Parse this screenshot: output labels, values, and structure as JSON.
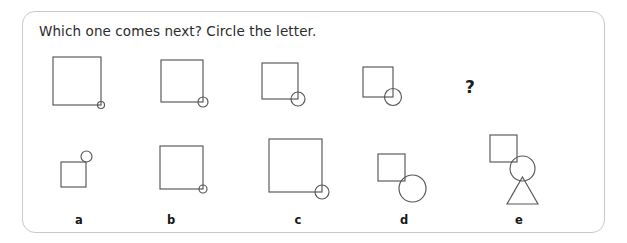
{
  "worksheet": {
    "prompt": "Which one comes next? Circle the letter.",
    "missing_marker": "?",
    "border_color": "#c9c9c9",
    "stroke_color": "#55565a",
    "text_color": "#2b2b2b",
    "background_color": "#ffffff"
  },
  "sequence": {
    "name": "square-shrinking-circle-growing",
    "items": [
      {
        "index": 1,
        "square_size": 48,
        "circle_diameter": 7,
        "circle_anchor": "bottom-right-corner",
        "left": 52,
        "top": 56
      },
      {
        "index": 2,
        "square_size": 42,
        "circle_diameter": 10,
        "circle_anchor": "bottom-right-corner",
        "left": 160,
        "top": 59
      },
      {
        "index": 3,
        "square_size": 36,
        "circle_diameter": 14,
        "circle_anchor": "bottom-right-corner",
        "left": 261,
        "top": 62
      },
      {
        "index": 4,
        "square_size": 30,
        "circle_diameter": 17,
        "circle_anchor": "bottom-right-corner",
        "left": 362,
        "top": 66
      }
    ],
    "question_mark": {
      "label": "?",
      "left": 464,
      "top": 76
    }
  },
  "options": [
    {
      "letter": "a",
      "letter_left": 68,
      "shapes": [
        {
          "type": "square",
          "size": 25,
          "left": 60,
          "top": 161
        },
        {
          "type": "circle",
          "diameter": 11,
          "left": 80,
          "top": 150
        }
      ],
      "description": "small square with small circle at top-right corner"
    },
    {
      "letter": "b",
      "letter_left": 160,
      "shapes": [
        {
          "type": "square",
          "size": 43,
          "left": 159,
          "top": 145
        },
        {
          "type": "circle",
          "diameter": 8,
          "left": 198,
          "top": 184
        }
      ],
      "description": "medium square with tiny circle at bottom-right corner"
    },
    {
      "letter": "c",
      "letter_left": 287,
      "shapes": [
        {
          "type": "square",
          "size": 53,
          "left": 268,
          "top": 138
        },
        {
          "type": "circle",
          "diameter": 14,
          "left": 314,
          "top": 184
        }
      ],
      "description": "large square with small circle at bottom-right corner"
    },
    {
      "letter": "d",
      "letter_left": 393,
      "shapes": [
        {
          "type": "square",
          "size": 27,
          "left": 377,
          "top": 153
        },
        {
          "type": "circle",
          "diameter": 27,
          "left": 398,
          "top": 174
        }
      ],
      "description": "small square with large circle at bottom-right corner"
    },
    {
      "letter": "e",
      "letter_left": 508,
      "shapes": [
        {
          "type": "square",
          "size": 27,
          "left": 489,
          "top": 134
        },
        {
          "type": "circle",
          "diameter": 25,
          "left": 509,
          "top": 155
        },
        {
          "type": "triangle",
          "width": 31,
          "height": 27,
          "left": 506,
          "top": 176
        }
      ],
      "description": "square, circle and triangle stacked diagonally"
    }
  ]
}
